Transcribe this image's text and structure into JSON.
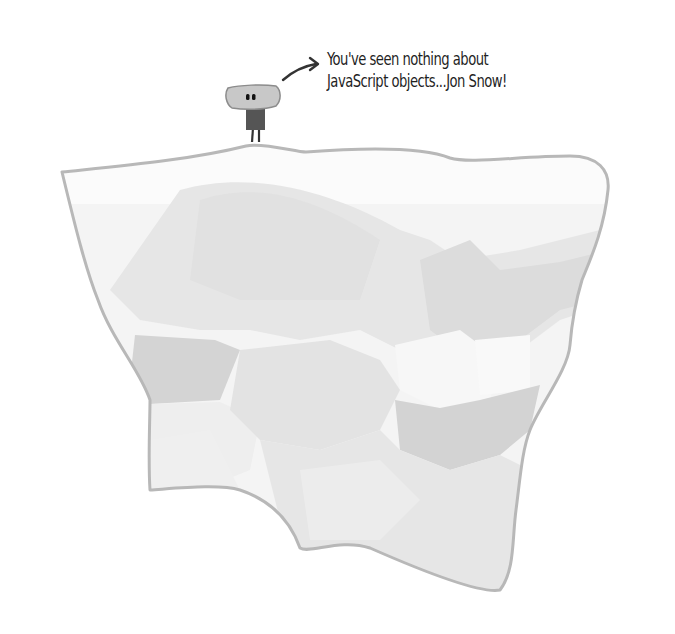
{
  "illustration": {
    "subject": "iceberg",
    "caption": {
      "line1": "You've seen nothing about",
      "line2": "JavaScript objects...Jon Snow!"
    },
    "character": "small-robot-character",
    "colors": {
      "background": "#ffffff",
      "iceberg_outline": "#b8b8b8",
      "iceberg_light": "#ececec",
      "iceberg_mid": "#dedede",
      "iceberg_dark": "#cfcfcf",
      "robot_head": "#c8c8c8",
      "robot_body": "#555555",
      "text": "#1f1f1f"
    }
  }
}
